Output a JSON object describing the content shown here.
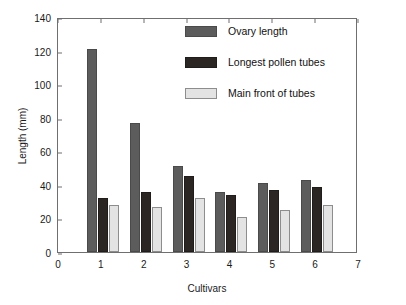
{
  "chart_data": {
    "type": "bar",
    "title": "",
    "xlabel": "Cultivars",
    "ylabel": "Length (mm)",
    "xlim": [
      0,
      7
    ],
    "ylim": [
      0,
      140
    ],
    "ytick_values": [
      0,
      20,
      40,
      60,
      80,
      100,
      120,
      140
    ],
    "ytick_labels": [
      "0",
      "20",
      "40",
      "60",
      "80",
      "100",
      "120",
      "140"
    ],
    "xtick_values": [
      0,
      1,
      2,
      3,
      4,
      5,
      6,
      7
    ],
    "xtick_labels": [
      "0",
      "1",
      "2",
      "3",
      "4",
      "5",
      "6",
      "7"
    ],
    "categories": [
      "1",
      "2",
      "3",
      "4",
      "5",
      "6"
    ],
    "grid": false,
    "legend_position": "upper center",
    "series": [
      {
        "name": "Ovary length",
        "color": "#5c5c5c",
        "values": [
          121,
          77,
          51,
          36,
          41,
          43
        ]
      },
      {
        "name": "Longest pollen tubes",
        "color": "#2b2623",
        "values": [
          32,
          36,
          45,
          34,
          37,
          39
        ]
      },
      {
        "name": "Main front of tubes",
        "color": "#e3e3e3",
        "values": [
          28,
          27,
          32,
          21,
          25,
          28
        ]
      }
    ]
  }
}
